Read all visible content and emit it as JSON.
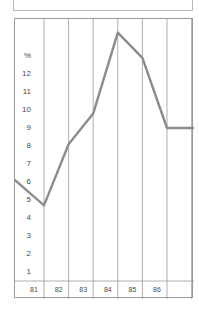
{
  "title_box": {
    "text": ""
  },
  "chart_data": {
    "type": "line",
    "title": "",
    "subtitle": "",
    "xlabel": "",
    "ylabel": "%",
    "unit_label": "%",
    "categories": [
      "81",
      "82",
      "83",
      "84",
      "85",
      "86",
      "87"
    ],
    "x": [
      81,
      82,
      83,
      84,
      85,
      86,
      87
    ],
    "values": [
      4.7,
      8.1,
      9.8,
      14.3,
      12.9,
      9.0,
      9.0
    ],
    "series": [
      {
        "name": "",
        "values": [
          4.7,
          8.1,
          9.8,
          14.3,
          12.9,
          9.0,
          9.0
        ],
        "color": "#8c8c8c"
      }
    ],
    "leading_point": {
      "x": 80.5,
      "value": 6.1
    },
    "ylim": [
      0,
      14.6
    ],
    "xlim": [
      80.5,
      87.5
    ],
    "yticks": [
      1,
      2,
      3,
      4,
      5,
      6,
      7,
      8,
      9,
      10,
      11,
      12
    ],
    "ytick_labels": [
      "1",
      "2",
      "3",
      "4",
      "5",
      "6",
      "7",
      "8",
      "9",
      "10",
      "11",
      "12"
    ],
    "top_axis_label": "%",
    "xtick_labels": [
      "81",
      "82",
      "83",
      "84",
      "85",
      "86",
      "87"
    ],
    "grid": {
      "vertical": true,
      "horizontal": false
    },
    "legend": {
      "visible": false,
      "position": "none"
    },
    "line_color": "#8c8c8c",
    "axis_color": "#999999",
    "grid_color": "#9a9a9a",
    "text_color": "#4a4a4a",
    "background": "#ffffff"
  }
}
